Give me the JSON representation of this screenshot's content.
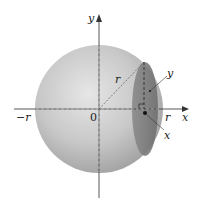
{
  "figure": {
    "colors": {
      "sphere_light": "#e2e2e2",
      "sphere_dark": "#9c9c9c",
      "cross_section": "#7d7d7d",
      "axis": "#444444",
      "text": "#222222"
    },
    "labels": {
      "y_axis": "y",
      "x_axis": "x",
      "neg_r": "−r",
      "origin": "0",
      "pos_r": "r",
      "radius": "r",
      "section_y": "y",
      "section_x": "x"
    }
  }
}
